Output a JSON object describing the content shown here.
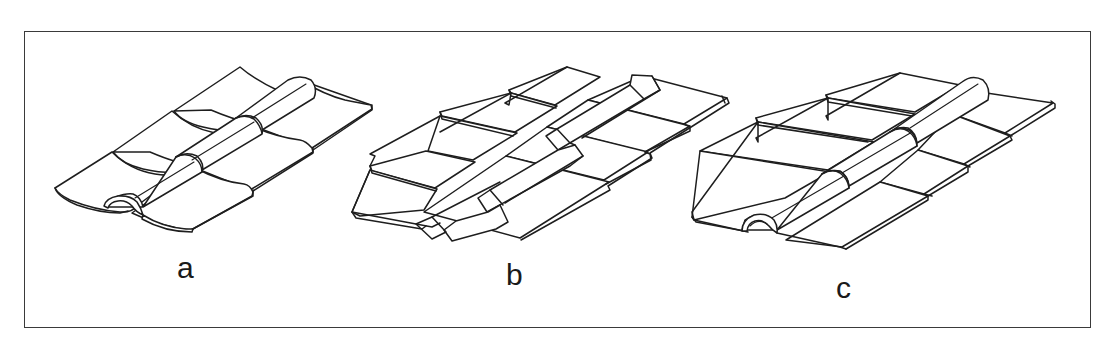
{
  "figure": {
    "panels": [
      {
        "id": "a",
        "label": "a",
        "description": "Curved pan tiles with semicircular cover tiles over the joint, three courses overlapping"
      },
      {
        "id": "b",
        "label": "b",
        "description": "Flat interlocking tiles with raised trapezoidal ridge cover between columns, three courses"
      },
      {
        "id": "c",
        "label": "c",
        "description": "Flat pan tiles with upturned edges and semicircular cover tiles over the joint, three courses"
      }
    ]
  }
}
